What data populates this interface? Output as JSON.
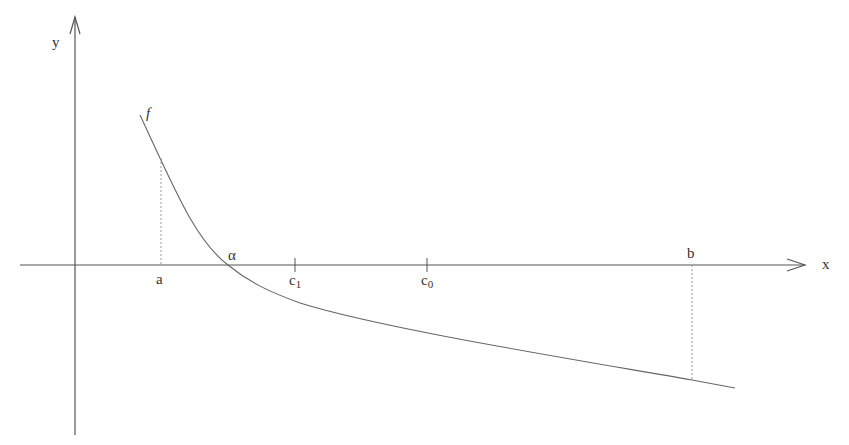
{
  "diagram": {
    "axes": {
      "x_label": "x",
      "y_label": "y"
    },
    "function_label": "f",
    "points": {
      "a": "a",
      "alpha": "α",
      "c1_base": "c",
      "c1_sub": "1",
      "c0_base": "c",
      "c0_sub": "0",
      "b": "b"
    },
    "colors": {
      "axis": "#555555",
      "curve": "#666666",
      "dotted": "#999999",
      "text": "#333333"
    }
  }
}
